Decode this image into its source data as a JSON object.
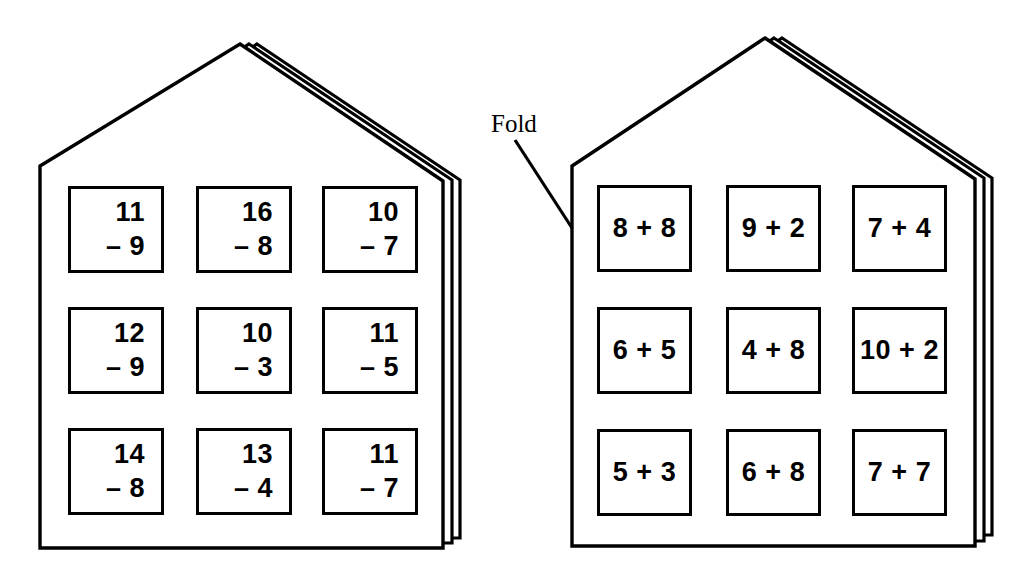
{
  "worksheet": {
    "title": "Subtraction and addition fact houses",
    "fold_label": "Fold"
  },
  "houses": [
    {
      "id": "left-house",
      "name": "subtraction-house",
      "operation": "subtraction",
      "cells": [
        {
          "top": "11",
          "bottom": "– 9",
          "minuend": 11,
          "subtrahend": 9,
          "expression": "11 - 9"
        },
        {
          "top": "16",
          "bottom": "– 8",
          "minuend": 16,
          "subtrahend": 8,
          "expression": "16 - 8"
        },
        {
          "top": "10",
          "bottom": "– 7",
          "minuend": 10,
          "subtrahend": 7,
          "expression": "10 - 7"
        },
        {
          "top": "12",
          "bottom": "– 9",
          "minuend": 12,
          "subtrahend": 9,
          "expression": "12 - 9"
        },
        {
          "top": "10",
          "bottom": "– 3",
          "minuend": 10,
          "subtrahend": 3,
          "expression": "10 - 3"
        },
        {
          "top": "11",
          "bottom": "– 5",
          "minuend": 11,
          "subtrahend": 5,
          "expression": "11 - 5"
        },
        {
          "top": "14",
          "bottom": "– 8",
          "minuend": 14,
          "subtrahend": 8,
          "expression": "14 - 8"
        },
        {
          "top": "13",
          "bottom": "– 4",
          "minuend": 13,
          "subtrahend": 4,
          "expression": "13 - 4"
        },
        {
          "top": "11",
          "bottom": "– 7",
          "minuend": 11,
          "subtrahend": 7,
          "expression": "11 - 7"
        }
      ]
    },
    {
      "id": "right-house",
      "name": "addition-house",
      "operation": "addition",
      "cells": [
        {
          "expression": "8 + 8",
          "addend_a": 8,
          "addend_b": 8
        },
        {
          "expression": "9 + 2",
          "addend_a": 9,
          "addend_b": 2
        },
        {
          "expression": "7 + 4",
          "addend_a": 7,
          "addend_b": 4
        },
        {
          "expression": "6 + 5",
          "addend_a": 6,
          "addend_b": 5
        },
        {
          "expression": "4 + 8",
          "addend_a": 4,
          "addend_b": 8
        },
        {
          "expression": "10 + 2",
          "addend_a": 10,
          "addend_b": 2
        },
        {
          "expression": "5 + 3",
          "addend_a": 5,
          "addend_b": 3
        },
        {
          "expression": "6 + 8",
          "addend_a": 6,
          "addend_b": 8
        },
        {
          "expression": "7 + 7",
          "addend_a": 7,
          "addend_b": 7
        }
      ]
    }
  ],
  "colors": {
    "ink": "#000000",
    "paper": "#ffffff"
  }
}
